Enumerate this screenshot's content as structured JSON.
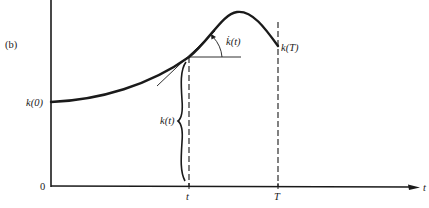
{
  "figure": {
    "panel_label": "(b)",
    "y_axis": {
      "origin_label": "0",
      "start_value_label": "k(0)"
    },
    "x_axis": {
      "axis_label": "t",
      "tick_labels": [
        "t",
        "T"
      ]
    },
    "annotations": {
      "slope_label": "k̇(t)",
      "height_label": "k(t)",
      "end_value_label": "k(T)"
    },
    "colors": {
      "ink": "#1a1a1a",
      "background": "#ffffff"
    }
  }
}
